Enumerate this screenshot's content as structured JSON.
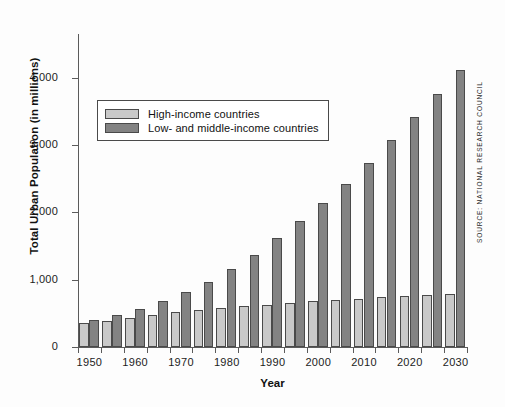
{
  "chart_data": {
    "type": "bar",
    "title": "",
    "xlabel": "Year",
    "ylabel": "Total Urban Population (in millions)",
    "ylim": [
      0,
      4400
    ],
    "yticks": [
      0,
      1000,
      2000,
      3000,
      4000
    ],
    "ytick_labels": [
      "0",
      "1,000",
      "2,000",
      "3,000",
      "4,000"
    ],
    "grid": false,
    "legend_position": "upper left",
    "categories": [
      "1950",
      "1955",
      "1960",
      "1965",
      "1970",
      "1975",
      "1980",
      "1985",
      "1990",
      "1995",
      "2000",
      "2005",
      "2010",
      "2015",
      "2020",
      "2025",
      "2030"
    ],
    "xtick_labels": [
      "1950",
      "1960",
      "1970",
      "1980",
      "1990",
      "2000",
      "2010",
      "2020",
      "2030"
    ],
    "xtick_categories": [
      "1950",
      "1960",
      "1970",
      "1980",
      "1990",
      "2000",
      "2010",
      "2020",
      "2030"
    ],
    "series": [
      {
        "name": "High-income countries",
        "color": "#c9c9c9",
        "values": [
          355,
          390,
          430,
          470,
          515,
          550,
          580,
          605,
          630,
          660,
          680,
          700,
          715,
          740,
          765,
          775,
          790
        ]
      },
      {
        "name": "Low- and middle-income countries",
        "color": "#838383",
        "values": [
          400,
          480,
          570,
          690,
          815,
          970,
          1165,
          1370,
          1620,
          1875,
          2140,
          2425,
          2740,
          3075,
          3415,
          3760,
          4125
        ]
      }
    ]
  },
  "legend": {
    "items": [
      {
        "label": "High-income countries",
        "swatch": "hi"
      },
      {
        "label": "Low- and middle-income countries",
        "swatch": "lm"
      }
    ]
  },
  "axes": {
    "y_title": "Total Urban Population (in millions)",
    "x_title": "Year"
  },
  "source": {
    "credit": "SOURCE: NATIONAL RESEARCH COUNCIL"
  },
  "colors": {
    "high_income": "#c9c9c9",
    "low_middle_income": "#838383",
    "axis": "#5b5b5b",
    "text": "#111111",
    "background": "#fdfdfd"
  }
}
